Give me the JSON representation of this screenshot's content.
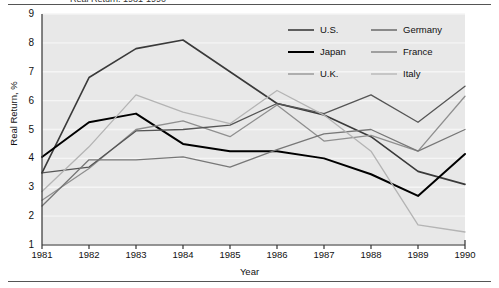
{
  "figure": {
    "title_partial": "Real Return, 1981-1990",
    "axis": {
      "ylabel": "Real Return, %",
      "xlabel": "Year",
      "yticks": [
        "9",
        "8",
        "7",
        "6",
        "5",
        "4",
        "3",
        "2",
        "1"
      ],
      "xticks": [
        "1981",
        "1982",
        "1983",
        "1984",
        "1985",
        "1986",
        "1987",
        "1988",
        "1989",
        "1990"
      ]
    },
    "legend": {
      "entries": [
        {
          "label": "U.S.",
          "color": "#3a3a3a",
          "width": 1.6
        },
        {
          "label": "Germany",
          "color": "#555555",
          "width": 1.3
        },
        {
          "label": "Japan",
          "color": "#000000",
          "width": 2.0
        },
        {
          "label": "France",
          "color": "#777777",
          "width": 1.3
        },
        {
          "label": "U.K.",
          "color": "#8f8f8f",
          "width": 1.3
        },
        {
          "label": "Italy",
          "color": "#b4b4b4",
          "width": 1.3
        }
      ]
    },
    "style": {
      "plot_background": "#e8e8e8",
      "gridline_color": "#f5f5f5",
      "axis_color": "#333333",
      "frame_color": "#555555"
    }
  },
  "chart_data": {
    "type": "line",
    "title": "Real Return, 1981-1990",
    "xlabel": "Year",
    "ylabel": "Real Return, %",
    "x": [
      1981,
      1982,
      1983,
      1984,
      1985,
      1986,
      1987,
      1988,
      1989,
      1990
    ],
    "xlim": [
      1981,
      1990
    ],
    "ylim": [
      1,
      9
    ],
    "grid": "horizontal",
    "legend_position": "top-right",
    "series": [
      {
        "name": "U.S.",
        "color": "#3a3a3a",
        "values": [
          3.5,
          6.8,
          7.8,
          8.1,
          7.0,
          5.9,
          5.5,
          4.75,
          3.55,
          3.1
        ]
      },
      {
        "name": "Japan",
        "color": "#000000",
        "values": [
          4.05,
          5.25,
          5.55,
          4.5,
          4.25,
          4.25,
          4.0,
          3.45,
          2.7,
          4.15
        ]
      },
      {
        "name": "U.K.",
        "color": "#8f8f8f",
        "values": [
          2.55,
          3.65,
          5.0,
          5.3,
          4.75,
          5.85,
          4.6,
          4.8,
          4.25,
          6.15
        ]
      },
      {
        "name": "Germany",
        "color": "#555555",
        "values": [
          3.5,
          3.7,
          4.95,
          5.0,
          5.15,
          5.9,
          5.55,
          6.2,
          5.25,
          6.5
        ]
      },
      {
        "name": "France",
        "color": "#777777",
        "values": [
          2.35,
          3.95,
          3.95,
          4.05,
          3.7,
          4.3,
          4.85,
          5.0,
          4.25,
          5.0
        ]
      },
      {
        "name": "Italy",
        "color": "#b4b4b4",
        "values": [
          2.85,
          4.4,
          6.2,
          5.6,
          5.2,
          6.35,
          5.5,
          4.25,
          1.7,
          1.45
        ]
      }
    ]
  }
}
